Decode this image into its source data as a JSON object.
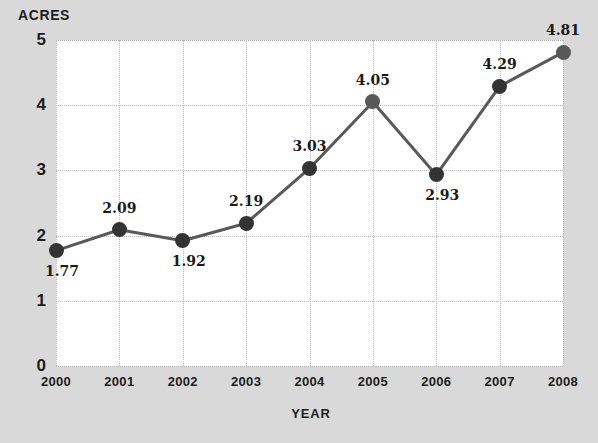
{
  "chart_data": {
    "type": "line",
    "title": "",
    "xlabel": "YEAR",
    "ylabel": "ACRES",
    "categories": [
      "2000",
      "2001",
      "2002",
      "2003",
      "2004",
      "2005",
      "2006",
      "2007",
      "2008"
    ],
    "values": [
      1.77,
      2.09,
      1.92,
      2.19,
      3.03,
      4.05,
      2.93,
      4.29,
      4.81
    ],
    "point_labels": [
      "1.77",
      "2.09",
      "1.92",
      "2.19",
      "3.03",
      "4.05",
      "2.93",
      "4.29",
      "4.81"
    ],
    "label_positions": [
      "below",
      "above",
      "below",
      "above",
      "above",
      "above",
      "below",
      "above",
      "above"
    ],
    "ylim": [
      0,
      5
    ],
    "yticks": [
      "0",
      "1",
      "2",
      "3",
      "4",
      "5"
    ],
    "ytick_values": [
      0,
      1,
      2,
      3,
      4,
      5
    ],
    "grid": true,
    "legend": "none",
    "series": [
      {
        "name": "Acres",
        "values": [
          1.77,
          2.09,
          1.92,
          2.19,
          3.03,
          4.05,
          2.93,
          4.29,
          4.81
        ]
      }
    ],
    "colors": {
      "background": "#d9d9d9",
      "plot_background": "#ffffff",
      "line": "#595959",
      "marker": "#333333",
      "grid": "#b9b9b9",
      "text": "#1d1d1d"
    }
  }
}
